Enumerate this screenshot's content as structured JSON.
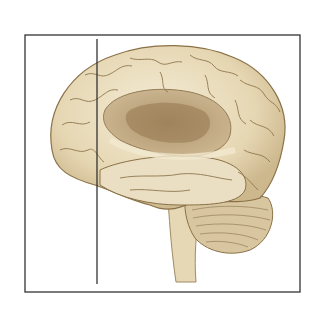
{
  "figure": {
    "overlay": {
      "rectangle": {
        "x": 25,
        "y": 35,
        "width": 275,
        "height": 257,
        "color": "#333333"
      },
      "vertical_line": {
        "x": 97,
        "y1": 39,
        "y2": 284,
        "color": "#333333"
      }
    },
    "colors": {
      "cortex": "#e9dcbc",
      "cortex_shadow": "#c9b48a",
      "sulci": "#8a7147",
      "limbic": "#b59a72",
      "limbic_dark": "#94774e",
      "cerebellum": "#d8c6a0",
      "brainstem": "#e6d7b5"
    }
  }
}
